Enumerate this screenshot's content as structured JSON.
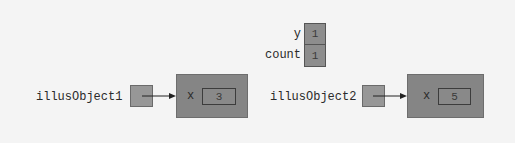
{
  "static_vars": [
    {
      "name": "y",
      "value": "1"
    },
    {
      "name": "count",
      "value": "1"
    }
  ],
  "references": [
    {
      "name": "illusObject1",
      "object": {
        "field": "x",
        "value": "3"
      }
    },
    {
      "name": "illusObject2",
      "object": {
        "field": "x",
        "value": "5"
      }
    }
  ],
  "colors": {
    "background": "#f4f4f4",
    "object_fill": "#858585",
    "reference_fill": "#979797",
    "arrow": "#222222"
  }
}
